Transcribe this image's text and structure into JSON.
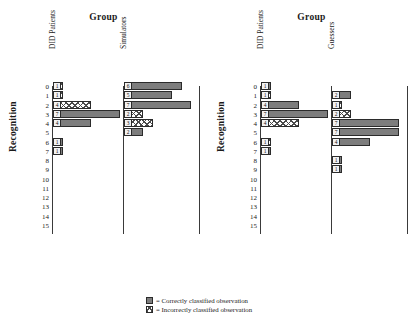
{
  "chart_data": {
    "type": "bar",
    "title": "Group",
    "ylabel": "Recognition",
    "xlabel": "",
    "orientation": "horizontal",
    "ylim": [
      0,
      15
    ],
    "grid": false,
    "ytick_labels": [
      "0",
      "1",
      "2",
      "3",
      "4",
      "5",
      "6",
      "7",
      "8",
      "9",
      "10",
      "11",
      "12",
      "13",
      "14",
      "15"
    ],
    "legend_position": "bottom-center",
    "legend": [
      {
        "key": "correct",
        "label": "= Correctly classified observation"
      },
      {
        "key": "incorrect",
        "label": "= Incorrectly classified observation"
      }
    ],
    "panels": [
      {
        "figure": "left",
        "title": "Group",
        "groups": [
          {
            "name": "DID Patients",
            "bars": [
              {
                "recognition": 0,
                "count": 1,
                "class": "incorrect"
              },
              {
                "recognition": 1,
                "count": 1,
                "class": "incorrect"
              },
              {
                "recognition": 2,
                "count": 4,
                "class": "incorrect"
              },
              {
                "recognition": 3,
                "count": 7,
                "class": "correct"
              },
              {
                "recognition": 4,
                "count": 4,
                "class": "correct"
              },
              {
                "recognition": 6,
                "count": 1,
                "class": "correct"
              },
              {
                "recognition": 7,
                "count": 1,
                "class": "correct"
              }
            ]
          },
          {
            "name": "Simulators",
            "bars": [
              {
                "recognition": 0,
                "count": 6,
                "class": "correct"
              },
              {
                "recognition": 1,
                "count": 5,
                "class": "correct"
              },
              {
                "recognition": 2,
                "count": 7,
                "class": "correct"
              },
              {
                "recognition": 3,
                "count": 2,
                "class": "incorrect"
              },
              {
                "recognition": 4,
                "count": 3,
                "class": "incorrect"
              },
              {
                "recognition": 5,
                "count": 2,
                "class": "correct"
              }
            ]
          }
        ]
      },
      {
        "figure": "right",
        "title": "Group",
        "groups": [
          {
            "name": "DID Patients",
            "bars": [
              {
                "recognition": 0,
                "count": 1,
                "class": "correct"
              },
              {
                "recognition": 1,
                "count": 1,
                "class": "incorrect"
              },
              {
                "recognition": 2,
                "count": 4,
                "class": "correct"
              },
              {
                "recognition": 3,
                "count": 7,
                "class": "correct"
              },
              {
                "recognition": 4,
                "count": 4,
                "class": "incorrect"
              },
              {
                "recognition": 6,
                "count": 1,
                "class": "incorrect"
              },
              {
                "recognition": 7,
                "count": 1,
                "class": "correct"
              }
            ]
          },
          {
            "name": "Guessers",
            "bars": [
              {
                "recognition": 1,
                "count": 2,
                "class": "correct"
              },
              {
                "recognition": 2,
                "count": 1,
                "class": "incorrect"
              },
              {
                "recognition": 3,
                "count": 2,
                "class": "incorrect"
              },
              {
                "recognition": 4,
                "count": 7,
                "class": "correct"
              },
              {
                "recognition": 5,
                "count": 7,
                "class": "correct"
              },
              {
                "recognition": 6,
                "count": 4,
                "class": "correct"
              },
              {
                "recognition": 8,
                "count": 1,
                "class": "correct"
              },
              {
                "recognition": 9,
                "count": 1,
                "class": "correct"
              }
            ]
          }
        ]
      }
    ]
  }
}
